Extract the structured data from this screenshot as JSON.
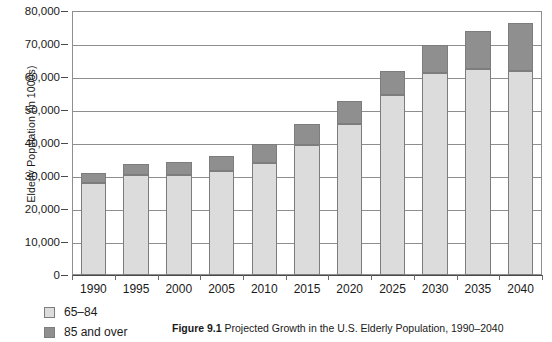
{
  "chart_data": {
    "type": "bar",
    "stacked": true,
    "title": "",
    "xlabel": "",
    "ylabel": "Elderly Population (in 1000s)",
    "ylim": [
      0,
      80000
    ],
    "ytick_interval": 10000,
    "ytick_labels": [
      "80,000",
      "70,000",
      "60,000",
      "50,000",
      "40,000",
      "30,000",
      "20,000",
      "10,000",
      "0"
    ],
    "ytick_values": [
      80000,
      70000,
      60000,
      50000,
      40000,
      30000,
      20000,
      10000,
      0
    ],
    "grid": true,
    "legend_position": "below-left",
    "categories": [
      "1990",
      "1995",
      "2000",
      "2005",
      "2010",
      "2015",
      "2020",
      "2025",
      "2030",
      "2035",
      "2040"
    ],
    "series": [
      {
        "name": "65–84",
        "color": "#dcdcdc",
        "values": [
          28000,
          30200,
          30400,
          31500,
          34100,
          39400,
          45900,
          54600,
          61300,
          62500,
          61900
        ]
      },
      {
        "name": "85 and over",
        "color": "#8f8f8f",
        "values": [
          3000,
          3300,
          4000,
          4700,
          5500,
          6300,
          6800,
          7300,
          8300,
          11400,
          14400
        ]
      }
    ],
    "totals": [
      31000,
      33500,
      34400,
      36200,
      39600,
      45700,
      52700,
      61900,
      69600,
      73900,
      76300
    ]
  },
  "caption": {
    "number": "Figure 9.1",
    "text": " Projected Growth in the U.S. Elderly Population, 1990–2040"
  },
  "colors": {
    "series_lower": "#dcdcdc",
    "series_upper": "#8f8f8f",
    "axis": "#4a4a4a",
    "grid": "#8e8e8e",
    "bar_outline": "#7d7d7d",
    "background": "#ffffff",
    "text": "#1a1a1a"
  }
}
